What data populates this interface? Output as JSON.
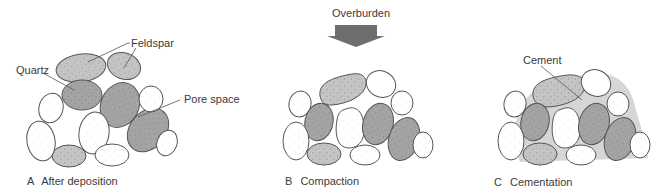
{
  "colors": {
    "background": "#ffffff",
    "feldspar_fill": "#c4c4c4",
    "quartz_fill": "#a4a4a4",
    "other_grain_fill": "#ffffff",
    "cement_fill": "#d6d6d6",
    "outline": "#555555",
    "arrow_fill": "#6e6e6e",
    "text": "#3a3a3a"
  },
  "overburden": {
    "label": "Overburden",
    "icon": "down-arrow-icon"
  },
  "panels": [
    {
      "id": "A",
      "letter": "A",
      "caption": "After deposition",
      "labels": [
        {
          "text": "Feldspar"
        },
        {
          "text": "Quartz"
        },
        {
          "text": "Pore space"
        }
      ]
    },
    {
      "id": "B",
      "letter": "B",
      "caption": "Compaction",
      "labels": []
    },
    {
      "id": "C",
      "letter": "C",
      "caption": "Cementation",
      "labels": [
        {
          "text": "Cement"
        }
      ]
    }
  ]
}
